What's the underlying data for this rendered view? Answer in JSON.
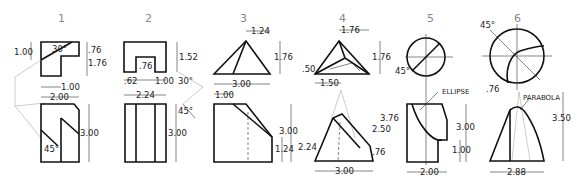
{
  "figures": [
    {
      "number": "1",
      "dims": [
        "30°",
        "1.00",
        ".76",
        "1.76",
        "1.00",
        "2.00",
        "3.00",
        "45°"
      ]
    },
    {
      "number": "2",
      "dims": [
        ".76",
        "1.52",
        ".62",
        "1.00",
        "2.24",
        "30°",
        "45°",
        "3.00"
      ]
    },
    {
      "number": "3",
      "dims": [
        "1.24",
        "1.76",
        "3.00",
        "1.00",
        "3.00",
        "1.24"
      ]
    },
    {
      "number": "4",
      "dims": [
        "1.76",
        "1.76",
        ".50",
        "1.50",
        "2.24",
        "3.76",
        "2.50",
        ".76",
        "3.00"
      ]
    },
    {
      "number": "5",
      "dims": [
        "45°",
        "ELLIPSE",
        "3.00",
        "1.00",
        "2.00"
      ]
    },
    {
      "number": "6",
      "dims": [
        "45°",
        ".76",
        "PARABOLA",
        "3.50",
        "2.88"
      ]
    }
  ]
}
